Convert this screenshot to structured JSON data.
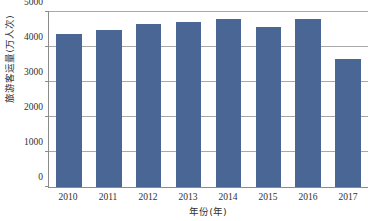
{
  "chart_data": {
    "type": "bar",
    "title": "",
    "xlabel": "年份(年)",
    "ylabel": "旅游客运量(万人次)",
    "categories": [
      "2010",
      "2011",
      "2012",
      "2013",
      "2014",
      "2015",
      "2016",
      "2017"
    ],
    "values": [
      4375,
      4490,
      4660,
      4720,
      4800,
      4575,
      4800,
      3670
    ],
    "series": [
      {
        "name": "旅游客运量",
        "values": [
          4375,
          4490,
          4660,
          4720,
          4800,
          4575,
          4800,
          3670
        ]
      }
    ],
    "ylim": [
      0,
      5000
    ],
    "yticks": [
      0,
      1000,
      2000,
      3000,
      4000,
      5000
    ],
    "ytick_labels": [
      "0",
      "1000",
      "2000",
      "3000",
      "4000",
      "5000"
    ],
    "grid": true,
    "grid_axis": "y",
    "legend": false,
    "legend_position": "none",
    "bar_color": "#4a6694",
    "axis_color": "#8b8b8b",
    "grid_color": "#a9a9a9",
    "background_color": "#ffffff"
  }
}
